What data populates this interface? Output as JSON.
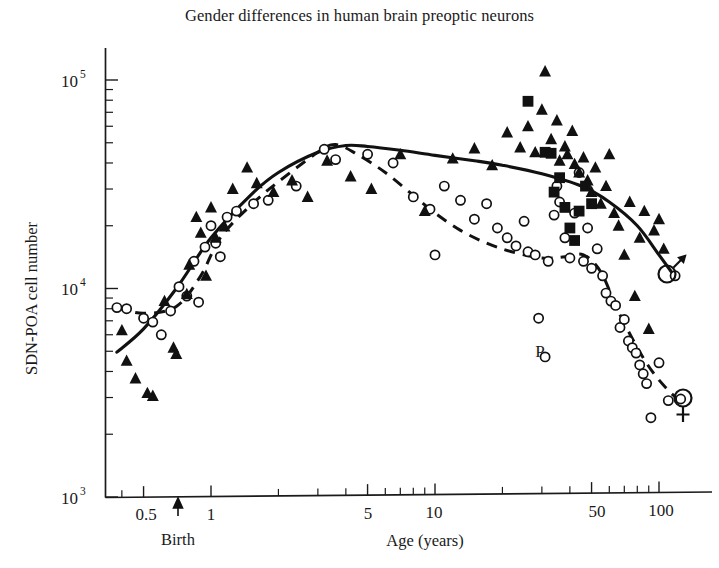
{
  "chart_data": {
    "type": "scatter",
    "title": "Gender differences in human brain preoptic neurons",
    "xlabel": "Age (years)",
    "ylabel": "SDN-POA cell number",
    "xscale": "log",
    "yscale": "log",
    "xlim": [
      0.33,
      160
    ],
    "ylim": [
      1000,
      160000
    ],
    "grid": false,
    "legend_position": "inline-curve-ends",
    "x_tick_labels": [
      "0.5",
      "1",
      "5",
      "10",
      "50",
      "100"
    ],
    "x_tick_values": [
      0.5,
      1,
      5,
      10,
      50,
      100
    ],
    "x_minor_ticks": [
      0.4,
      2,
      3,
      4,
      6,
      7,
      8,
      9,
      20,
      30,
      40,
      60,
      70,
      80,
      90
    ],
    "y_tick_labels": [
      "10^3",
      "10^4",
      "10^5"
    ],
    "y_tick_values": [
      1000,
      10000,
      100000
    ],
    "y_tick_mantissas": [
      "10",
      "10",
      "10"
    ],
    "y_tick_exponents": [
      "3",
      "4",
      "5"
    ],
    "annotations": [
      {
        "name": "birth-marker",
        "text": "Birth",
        "x": 0.75,
        "note": "upward arrow on axis at birth age"
      },
      {
        "name": "p-label",
        "text": "P",
        "x": 28,
        "y": 5600
      },
      {
        "name": "male-curve-end-symbol",
        "text": "male-symbol",
        "x": 115,
        "y": 11500
      },
      {
        "name": "female-curve-end-symbol",
        "text": "female-symbol",
        "x": 130,
        "y": 2950
      }
    ],
    "series": [
      {
        "name": "Male",
        "marker": "filled-triangle",
        "color": "#111111",
        "points": [
          [
            0.4,
            6300
          ],
          [
            0.42,
            4500
          ],
          [
            0.46,
            3700
          ],
          [
            0.52,
            3150
          ],
          [
            0.55,
            3050
          ],
          [
            0.62,
            8700
          ],
          [
            0.68,
            5200
          ],
          [
            0.7,
            4850
          ],
          [
            0.78,
            9400
          ],
          [
            0.8,
            13000
          ],
          [
            0.86,
            22000
          ],
          [
            0.9,
            18500
          ],
          [
            0.95,
            11500
          ],
          [
            1.0,
            24500
          ],
          [
            1.05,
            17500
          ],
          [
            1.15,
            19800
          ],
          [
            1.25,
            30000
          ],
          [
            1.45,
            38000
          ],
          [
            1.6,
            32000
          ],
          [
            1.9,
            29000
          ],
          [
            2.3,
            33000
          ],
          [
            2.7,
            27500
          ],
          [
            3.3,
            41000
          ],
          [
            4.2,
            34500
          ],
          [
            5.2,
            30000
          ],
          [
            7.0,
            44000
          ],
          [
            9.0,
            23500
          ],
          [
            12.0,
            42000
          ],
          [
            15.0,
            47000
          ],
          [
            18.0,
            39000
          ],
          [
            21.0,
            56000
          ],
          [
            24.0,
            47500
          ],
          [
            26.0,
            60000
          ],
          [
            28.0,
            45000
          ],
          [
            30.0,
            72000
          ],
          [
            31.0,
            110000
          ],
          [
            33.0,
            52000
          ],
          [
            35.0,
            64000
          ],
          [
            36.0,
            41000
          ],
          [
            38.0,
            48000
          ],
          [
            39.0,
            44000
          ],
          [
            41.0,
            57000
          ],
          [
            42.0,
            39500
          ],
          [
            44.0,
            36000
          ],
          [
            46.0,
            42500
          ],
          [
            48.0,
            33000
          ],
          [
            50.0,
            29000
          ],
          [
            52.0,
            38000
          ],
          [
            55.0,
            25500
          ],
          [
            58.0,
            31000
          ],
          [
            60.0,
            44000
          ],
          [
            63.0,
            23000
          ],
          [
            66.0,
            20000
          ],
          [
            70.0,
            14500
          ],
          [
            74.0,
            26000
          ],
          [
            78.0,
            9200
          ],
          [
            82.0,
            17500
          ],
          [
            86.0,
            23500
          ],
          [
            90.0,
            6400
          ],
          [
            95.0,
            19000
          ],
          [
            100.0,
            21500
          ],
          [
            105.0,
            15500
          ]
        ]
      },
      {
        "name": "Female",
        "marker": "open-circle",
        "color": "#111111",
        "points": [
          [
            0.38,
            8100
          ],
          [
            0.42,
            8000
          ],
          [
            0.5,
            7200
          ],
          [
            0.55,
            6900
          ],
          [
            0.6,
            6000
          ],
          [
            0.66,
            7800
          ],
          [
            0.72,
            10200
          ],
          [
            0.78,
            9200
          ],
          [
            0.84,
            13500
          ],
          [
            0.88,
            8600
          ],
          [
            0.94,
            15800
          ],
          [
            1.0,
            20000
          ],
          [
            1.05,
            16500
          ],
          [
            1.1,
            14200
          ],
          [
            1.18,
            22000
          ],
          [
            1.3,
            23500
          ],
          [
            1.55,
            25500
          ],
          [
            1.8,
            26500
          ],
          [
            2.4,
            31000
          ],
          [
            3.2,
            46500
          ],
          [
            3.6,
            41500
          ],
          [
            5.0,
            44000
          ],
          [
            6.5,
            40000
          ],
          [
            8.0,
            27500
          ],
          [
            9.5,
            24000
          ],
          [
            10.0,
            14500
          ],
          [
            11.0,
            31000
          ],
          [
            13.0,
            26500
          ],
          [
            15.0,
            21500
          ],
          [
            17.0,
            25500
          ],
          [
            19.0,
            19500
          ],
          [
            21.0,
            17500
          ],
          [
            23.0,
            16000
          ],
          [
            25.0,
            21000
          ],
          [
            26.0,
            15000
          ],
          [
            28.0,
            14500
          ],
          [
            29.0,
            7200
          ],
          [
            31.0,
            4700
          ],
          [
            32.0,
            13500
          ],
          [
            34.0,
            22500
          ],
          [
            35.0,
            31000
          ],
          [
            36.0,
            26000
          ],
          [
            38.0,
            17500
          ],
          [
            40.0,
            14000
          ],
          [
            42.0,
            23000
          ],
          [
            44.0,
            36000
          ],
          [
            46.0,
            13500
          ],
          [
            48.0,
            19500
          ],
          [
            50.0,
            12500
          ],
          [
            53.0,
            15500
          ],
          [
            56.0,
            11500
          ],
          [
            58.0,
            9500
          ],
          [
            61.0,
            8700
          ],
          [
            64.0,
            8300
          ],
          [
            67.0,
            6500
          ],
          [
            70.0,
            7100
          ],
          [
            73.0,
            5600
          ],
          [
            76.0,
            5200
          ],
          [
            79.0,
            4900
          ],
          [
            82.0,
            4300
          ],
          [
            85.0,
            3900
          ],
          [
            88.0,
            3500
          ],
          [
            92.0,
            2400
          ],
          [
            100.0,
            4400
          ],
          [
            110.0,
            2900
          ],
          [
            118.0,
            11500
          ],
          [
            125.0,
            2950
          ]
        ]
      },
      {
        "name": "Group 3",
        "marker": "filled-square",
        "color": "#111111",
        "points": [
          [
            26.0,
            79000
          ],
          [
            31.0,
            45000
          ],
          [
            33.0,
            44500
          ],
          [
            34.0,
            29000
          ],
          [
            36.0,
            34000
          ],
          [
            38.0,
            24500
          ],
          [
            40.0,
            19500
          ],
          [
            42.0,
            17000
          ],
          [
            44.0,
            23500
          ],
          [
            47.0,
            31000
          ],
          [
            50.0,
            25500
          ]
        ]
      }
    ],
    "fit_curves": [
      {
        "name": "male-fit",
        "style": "solid",
        "label_symbol": "male-symbol",
        "points": [
          [
            0.38,
            4950
          ],
          [
            0.5,
            6400
          ],
          [
            0.7,
            10000
          ],
          [
            1.0,
            17500
          ],
          [
            1.5,
            28000
          ],
          [
            2.0,
            36000
          ],
          [
            3.0,
            45000
          ],
          [
            4.0,
            48500
          ],
          [
            5.0,
            48000
          ],
          [
            7.0,
            46000
          ],
          [
            10.0,
            43500
          ],
          [
            15.0,
            41000
          ],
          [
            20.0,
            39000
          ],
          [
            30.0,
            35500
          ],
          [
            45.0,
            31000
          ],
          [
            60.0,
            26000
          ],
          [
            80.0,
            20000
          ],
          [
            100.0,
            14500
          ],
          [
            115.0,
            11800
          ]
        ]
      },
      {
        "name": "female-fit",
        "style": "dashed",
        "label_symbol": "female-symbol",
        "points": [
          [
            0.38,
            8100
          ],
          [
            0.5,
            7600
          ],
          [
            0.7,
            8200
          ],
          [
            0.9,
            11500
          ],
          [
            1.1,
            17500
          ],
          [
            1.5,
            25000
          ],
          [
            2.0,
            32500
          ],
          [
            3.0,
            45000
          ],
          [
            3.6,
            49000
          ],
          [
            4.5,
            44000
          ],
          [
            6.0,
            36000
          ],
          [
            8.0,
            28000
          ],
          [
            10.0,
            23000
          ],
          [
            13.0,
            19000
          ],
          [
            17.0,
            16500
          ],
          [
            22.0,
            15000
          ],
          [
            30.0,
            14000
          ],
          [
            38.0,
            14200
          ],
          [
            46.0,
            14500
          ],
          [
            55.0,
            12000
          ],
          [
            65.0,
            8000
          ],
          [
            80.0,
            5200
          ],
          [
            95.0,
            3900
          ],
          [
            115.0,
            3100
          ],
          [
            128.0,
            2900
          ]
        ]
      }
    ]
  },
  "figure": {
    "title": "Gender differences in human brain preoptic neurons",
    "x_axis_title": "Age (years)",
    "y_axis_title": "SDN-POA cell number",
    "birth_label": "Birth",
    "p_label": "P",
    "tick_0_5": "0.5",
    "tick_1": "1",
    "tick_5": "5",
    "tick_10": "10",
    "tick_50": "50",
    "tick_100": "100",
    "y_base": "10",
    "y_exp_3": "3",
    "y_exp_4": "4",
    "y_exp_5": "5"
  }
}
